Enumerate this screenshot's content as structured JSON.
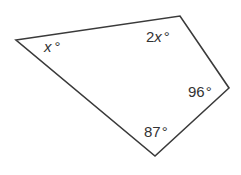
{
  "diagram": {
    "type": "quadrilateral",
    "stroke_color": "#3a3a3a",
    "vertices": [
      {
        "name": "left",
        "x": 16,
        "y": 40
      },
      {
        "name": "top-right",
        "x": 180,
        "y": 16
      },
      {
        "name": "right",
        "x": 229,
        "y": 88
      },
      {
        "name": "bottom",
        "x": 155,
        "y": 156
      }
    ],
    "angles": [
      {
        "vertex": "left",
        "coef": "",
        "var": "x",
        "unit": "°"
      },
      {
        "vertex": "top-right",
        "coef": "2",
        "var": "x",
        "unit": "°"
      },
      {
        "vertex": "right",
        "value": "96",
        "unit": "°"
      },
      {
        "vertex": "bottom",
        "value": "87",
        "unit": "°"
      }
    ]
  }
}
